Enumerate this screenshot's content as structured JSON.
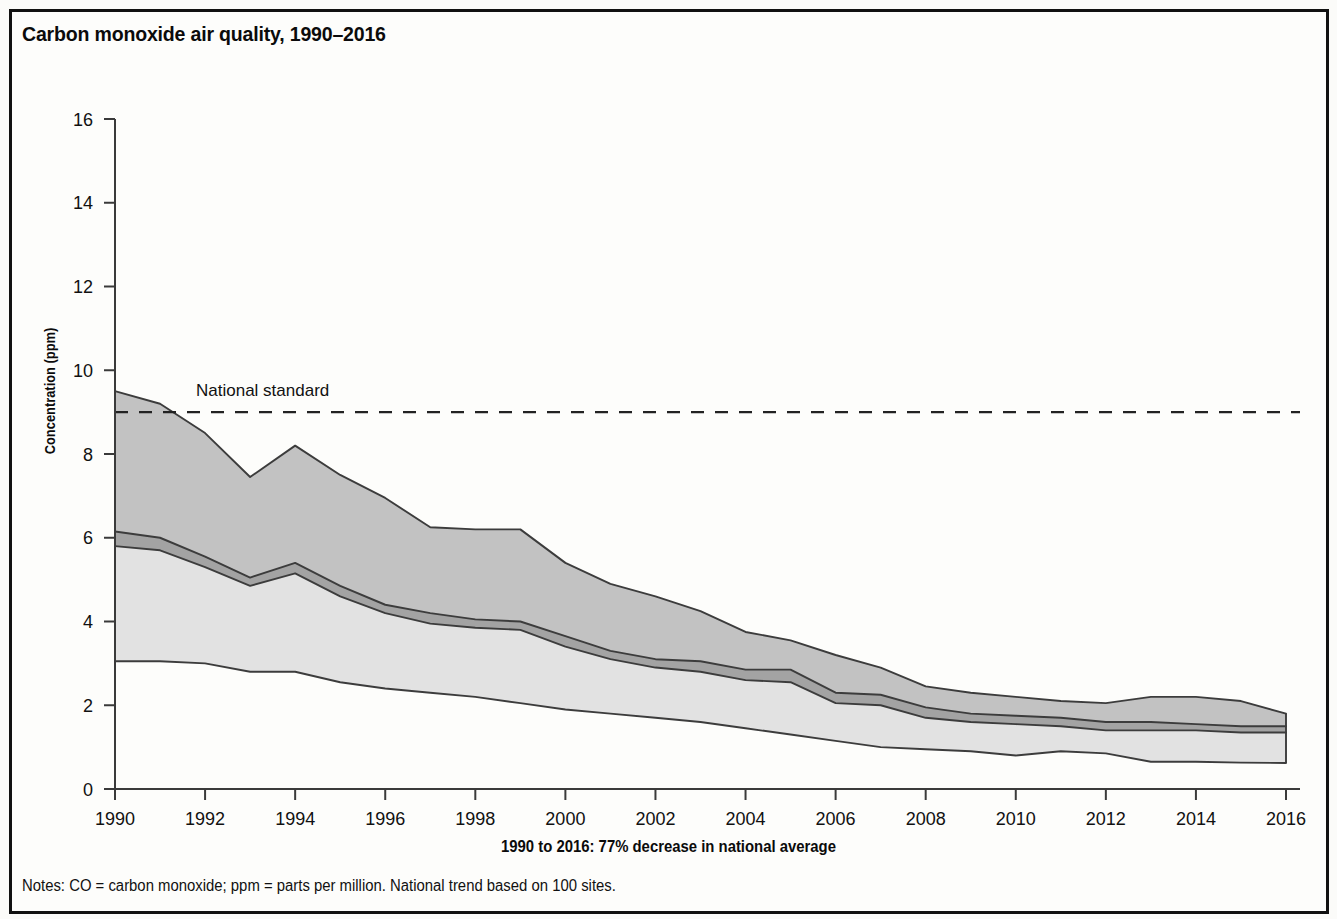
{
  "figure": {
    "title": "Carbon monoxide air quality, 1990–2016",
    "subtitle": "1990 to 2016: 77% decrease in national average",
    "notes": "Notes: CO = carbon monoxide; ppm = parts per million. National trend based on 100 sites.",
    "standard_label": "National standard",
    "ylabel": "Concentration (ppm)",
    "xlabel": ""
  },
  "colors": {
    "band_upper": "#c2c2c2",
    "band_mean": "#a3a3a3",
    "band_lower": "#e2e2e2",
    "line": "#3c3c3c",
    "axis": "#3a3a3a",
    "frame": "#111111",
    "text": "#111111",
    "background": "#fdfdfb"
  },
  "chart_data": {
    "type": "area",
    "title": "Carbon monoxide air quality, 1990–2016",
    "subtitle": "1990 to 2016: 77% decrease in national average",
    "xlabel": "",
    "ylabel": "Concentration (ppm)",
    "xlim": [
      1990,
      2016
    ],
    "ylim": [
      0,
      16
    ],
    "yticks": [
      0,
      2,
      4,
      6,
      8,
      10,
      12,
      14,
      16
    ],
    "xticks": [
      1990,
      1992,
      1994,
      1996,
      1998,
      2000,
      2002,
      2004,
      2006,
      2008,
      2010,
      2012,
      2014,
      2016
    ],
    "grid": false,
    "legend": "none",
    "annotations": [
      {
        "text": "National standard",
        "y": 9.0,
        "type": "dashed-hline",
        "x_text": 1992.0
      }
    ],
    "x": [
      1990,
      1991,
      1992,
      1993,
      1994,
      1995,
      1996,
      1997,
      1998,
      1999,
      2000,
      2001,
      2002,
      2003,
      2004,
      2005,
      2006,
      2007,
      2008,
      2009,
      2010,
      2011,
      2012,
      2013,
      2014,
      2015,
      2016
    ],
    "series": [
      {
        "name": "90th percentile",
        "values": [
          9.5,
          9.2,
          8.5,
          7.45,
          8.2,
          7.5,
          6.95,
          6.25,
          6.2,
          6.2,
          5.4,
          4.9,
          4.6,
          4.25,
          3.75,
          3.55,
          3.2,
          2.9,
          2.45,
          2.3,
          2.2,
          2.1,
          2.05,
          2.2,
          2.2,
          2.1,
          1.8
        ]
      },
      {
        "name": "Mean (upper edge)",
        "values": [
          6.15,
          6.0,
          5.55,
          5.05,
          5.4,
          4.85,
          4.4,
          4.2,
          4.05,
          4.0,
          3.65,
          3.3,
          3.1,
          3.05,
          2.85,
          2.85,
          2.3,
          2.25,
          1.95,
          1.8,
          1.75,
          1.7,
          1.6,
          1.6,
          1.55,
          1.5,
          1.5
        ]
      },
      {
        "name": "Mean (lower edge)",
        "values": [
          5.8,
          5.7,
          5.3,
          4.85,
          5.15,
          4.6,
          4.2,
          3.95,
          3.85,
          3.8,
          3.4,
          3.1,
          2.9,
          2.8,
          2.6,
          2.55,
          2.05,
          2.0,
          1.7,
          1.6,
          1.55,
          1.5,
          1.4,
          1.4,
          1.4,
          1.35,
          1.35
        ]
      },
      {
        "name": "10th percentile",
        "values": [
          3.05,
          3.05,
          3.0,
          2.8,
          2.8,
          2.55,
          2.4,
          2.3,
          2.2,
          2.05,
          1.9,
          1.8,
          1.7,
          1.6,
          1.45,
          1.3,
          1.15,
          1.0,
          0.95,
          0.9,
          0.8,
          0.9,
          0.85,
          0.65,
          0.65,
          0.63,
          0.62
        ]
      }
    ],
    "national_standard_ppm": 9.0
  },
  "axis_labels": {
    "y": [
      "0",
      "2",
      "4",
      "6",
      "8",
      "10",
      "12",
      "14",
      "16"
    ],
    "x": [
      "1990",
      "1992",
      "1994",
      "1996",
      "1998",
      "2000",
      "2002",
      "2004",
      "2006",
      "2008",
      "2010",
      "2012",
      "2014",
      "2016"
    ]
  }
}
